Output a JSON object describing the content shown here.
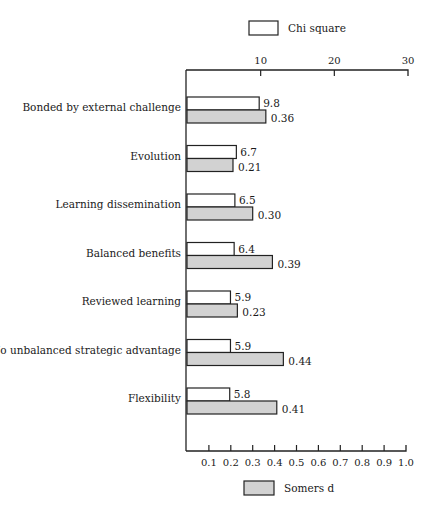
{
  "chart_data": {
    "type": "bar",
    "orientation": "horizontal",
    "title": "",
    "categories": [
      "Bonded by external challenge",
      "Evolution",
      "Learning dissemination",
      "Balanced benefits",
      "Reviewed learning",
      "No unbalanced strategic advantage",
      "Flexibility"
    ],
    "series": [
      {
        "name": "Chi square",
        "axis": "top",
        "values": [
          9.8,
          6.7,
          6.5,
          6.4,
          5.9,
          5.9,
          5.8
        ],
        "labels": [
          "9.8",
          "6.7",
          "6.5",
          "6.4",
          "5.9",
          "5.9",
          "5.8"
        ],
        "color": "#ffffff"
      },
      {
        "name": "Somers d",
        "axis": "bottom",
        "values": [
          0.36,
          0.21,
          0.3,
          0.39,
          0.23,
          0.44,
          0.41
        ],
        "labels": [
          "0.36",
          "0.21",
          "0.30",
          "0.39",
          "0.23",
          "0.44",
          "0.41"
        ],
        "color": "#d2d2d2"
      }
    ],
    "top_axis": {
      "range": [
        0,
        30
      ],
      "ticks": [
        10,
        20,
        30
      ],
      "tick_labels": [
        "10",
        "20",
        "30"
      ]
    },
    "bottom_axis": {
      "range": [
        0,
        1.0
      ],
      "ticks": [
        0.1,
        0.2,
        0.3,
        0.4,
        0.5,
        0.6,
        0.7,
        0.8,
        0.9,
        1.0
      ],
      "tick_labels": [
        "0.1",
        "0.2",
        "0.3",
        "0.4",
        "0.5",
        "0.6",
        "0.7",
        "0.8",
        "0.9",
        "1.0"
      ]
    },
    "legend": {
      "top": "Chi square",
      "bottom": "Somers d"
    },
    "grid": false
  }
}
